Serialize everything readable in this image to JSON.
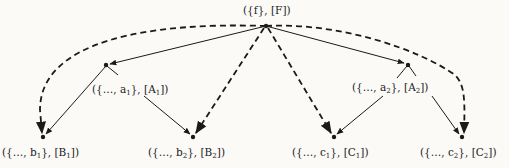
{
  "diagram": {
    "type": "tree",
    "root": {
      "id": "F",
      "set": "{f}",
      "label": "F",
      "text": "({f}, [F])"
    },
    "nodes": [
      {
        "id": "A1",
        "text_pre": "({…, a",
        "sub": "1",
        "text_mid": "}, [A",
        "sub2": "1",
        "text_post": "])"
      },
      {
        "id": "A2",
        "text_pre": "({…, a",
        "sub": "2",
        "text_mid": "}, [A",
        "sub2": "2",
        "text_post": "])"
      },
      {
        "id": "B1",
        "text_pre": "({…, b",
        "sub": "1",
        "text_mid": "}, [B",
        "sub2": "1",
        "text_post": "])"
      },
      {
        "id": "B2",
        "text_pre": "({…, b",
        "sub": "2",
        "text_mid": "}, [B",
        "sub2": "2",
        "text_post": "])"
      },
      {
        "id": "C1",
        "text_pre": "({…, c",
        "sub": "1",
        "text_mid": "}, [C",
        "sub2": "1",
        "text_post": "])"
      },
      {
        "id": "C2",
        "text_pre": "({…, c",
        "sub": "2",
        "text_mid": "}, [C",
        "sub2": "2",
        "text_post": "])"
      }
    ],
    "solid_edges": [
      {
        "from": "F",
        "to": "A1"
      },
      {
        "from": "F",
        "to": "A2"
      },
      {
        "from": "A1",
        "to": "B1"
      },
      {
        "from": "A1",
        "to": "B2"
      },
      {
        "from": "A2",
        "to": "C1"
      },
      {
        "from": "A2",
        "to": "C2"
      }
    ],
    "dashed_edges": [
      {
        "from": "F",
        "to": "B1"
      },
      {
        "from": "F",
        "to": "B2"
      },
      {
        "from": "F",
        "to": "C1"
      },
      {
        "from": "F",
        "to": "C2"
      }
    ],
    "colors": {
      "ink": "#1a1a1a",
      "paper": "#fbfaf7"
    }
  }
}
